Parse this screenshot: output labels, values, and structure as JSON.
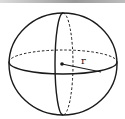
{
  "diagram": {
    "labels": {
      "radius": "r"
    },
    "elements": [
      "outline-circle",
      "equator-front-solid",
      "equator-back-dashed",
      "meridian-front-solid",
      "meridian-back-dashed",
      "center-point",
      "radius-line"
    ],
    "colors": {
      "stroke": "#1a1a1a",
      "background": "#ffffff",
      "topbar": "#9a9a9a"
    }
  }
}
